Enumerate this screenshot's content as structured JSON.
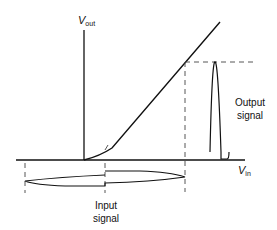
{
  "diagram": {
    "axes": {
      "y_axis": {
        "symbol": "V",
        "subscript": "out"
      },
      "x_axis": {
        "symbol": "V",
        "subscript": "in"
      }
    },
    "labels": {
      "output_signal_line1": "Output",
      "output_signal_line2": "signal",
      "input_signal_line1": "Input",
      "input_signal_line2": "signal"
    },
    "colors": {
      "line": "#111111",
      "dashed": "#444444",
      "background": "#ffffff"
    }
  }
}
